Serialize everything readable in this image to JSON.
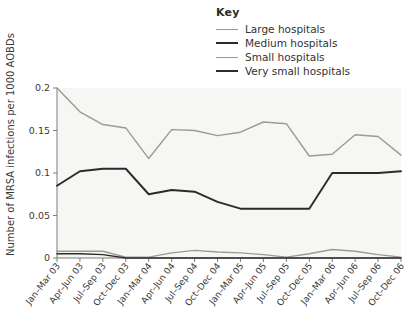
{
  "legend": {
    "title": "Key",
    "entries": [
      {
        "label": "Large hospitals",
        "color": "#9a9a9a",
        "width": 1.6
      },
      {
        "label": "Medium hospitals",
        "color": "#2b2b2b",
        "width": 2.0
      },
      {
        "label": "Small hospitals",
        "color": "#9a9a9a",
        "width": 1.6
      },
      {
        "label": "Very small hospitals",
        "color": "#2b2b2b",
        "width": 2.0
      }
    ]
  },
  "colors": {
    "plot_background": "#f6f6f4",
    "axis": "#7d7d7d",
    "text": "#3a3a3a",
    "large": "#9a9a9a",
    "medium": "#2b2b2b",
    "small": "#9a9a9a",
    "very_small": "#2b2b2b"
  },
  "chart_data": {
    "type": "line",
    "title": "",
    "xlabel": "",
    "ylabel": "Number of MRSA infections  per 1000 AOBDs",
    "ylim": [
      0,
      0.2
    ],
    "yticks": [
      0,
      0.05,
      0.1,
      0.15,
      0.2
    ],
    "ytick_labels": [
      "0",
      "0.05",
      "0.1",
      "0.15",
      "0.2"
    ],
    "grid": false,
    "legend_position": "top-right",
    "categories": [
      "Jan–Mar 03",
      "Apr–Jun 03",
      "Jul–Sep 03",
      "Oct–Dec 03",
      "Jan–Mar 04",
      "Apr–Jun 04",
      "Jul–Sep 04",
      "Oct–Dec 04",
      "Jan–Mar 05",
      "Apr–Jun 05",
      "Jul–Sep 05",
      "Oct–Dec 05",
      "Jan–Mar 06",
      "Apr–Jun 06",
      "Jul–Sep 06",
      "Oct–Dec 06"
    ],
    "series": [
      {
        "name": "Large hospitals",
        "color": "#9a9a9a",
        "values": [
          0.2,
          0.172,
          0.157,
          0.153,
          0.117,
          0.151,
          0.15,
          0.144,
          0.148,
          0.16,
          0.158,
          0.12,
          0.122,
          0.145,
          0.143,
          0.121
        ]
      },
      {
        "name": "Medium hospitals",
        "color": "#2b2b2b",
        "values": [
          0.085,
          0.102,
          0.105,
          0.105,
          0.075,
          0.08,
          0.078,
          0.066,
          0.058,
          0.058,
          0.058,
          0.058,
          0.1,
          0.1,
          0.1,
          0.102
        ]
      },
      {
        "name": "Small hospitals",
        "color": "#9a9a9a",
        "values": [
          0.008,
          0.008,
          0.008,
          0.001,
          0.001,
          0.006,
          0.009,
          0.007,
          0.006,
          0.004,
          0.001,
          0.005,
          0.01,
          0.008,
          0.004,
          0.001
        ]
      },
      {
        "name": "Very small hospitals",
        "color": "#2b2b2b",
        "values": [
          0.005,
          0.005,
          0.004,
          0.0,
          0.0,
          0.0,
          0.0,
          0.0,
          0.0,
          0.0,
          0.0,
          0.0,
          0.0,
          0.0,
          0.0,
          0.0
        ]
      }
    ],
    "series_right_tail": {
      "large": [
        0.121,
        0.153
      ],
      "medium": [
        0.12,
        0.058,
        0.058,
        0.065
      ],
      "small": [
        0.001,
        0.006,
        0.01,
        0.013
      ]
    }
  }
}
